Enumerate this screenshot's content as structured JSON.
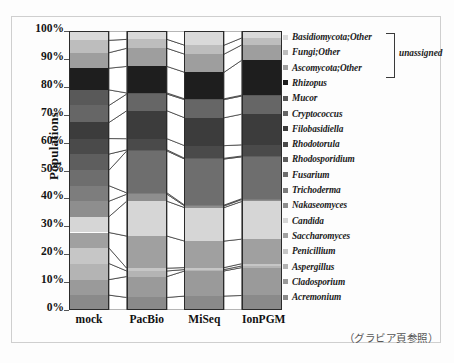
{
  "chart_data": {
    "type": "bar",
    "title": "",
    "xlabel": "",
    "ylabel": "Populations",
    "ylim": [
      0,
      100
    ],
    "ytick_labels": [
      "100%",
      "90%",
      "80%",
      "70%",
      "60%",
      "50%",
      "40%",
      "30%",
      "20%",
      "10%",
      "0%"
    ],
    "ytick_values": [
      100,
      90,
      80,
      70,
      60,
      50,
      40,
      30,
      20,
      10,
      0
    ],
    "categories": [
      "mock",
      "PacBio",
      "MiSeq",
      "IonPGM"
    ],
    "stack_order": "bottom-to-top",
    "grid": false,
    "legend_position": "right",
    "annotations": [
      {
        "text": "unassigned",
        "covers": [
          "Basidiomycota;Other",
          "Fungi;Other",
          "Ascomycota;Other"
        ]
      }
    ],
    "series": [
      {
        "name": "Acremonium",
        "color": "#8a8a8a",
        "values": [
          4.8,
          4.5,
          5.0,
          5.2
        ]
      },
      {
        "name": "Cladosporium",
        "color": "#9a9a9a",
        "values": [
          5.0,
          7.5,
          9.0,
          10.0
        ]
      },
      {
        "name": "Aspergillus",
        "color": "#b4b4b4",
        "values": [
          5.2,
          2.0,
          0.5,
          0.6
        ]
      },
      {
        "name": "Penicillium",
        "color": "#c6c6c6",
        "values": [
          5.0,
          1.0,
          0.7,
          0.8
        ]
      },
      {
        "name": "Saccharomyces",
        "color": "#a0a0a0",
        "values": [
          5.0,
          11.5,
          9.5,
          8.8
        ]
      },
      {
        "name": "Candida",
        "color": "#d6d6d6",
        "values": [
          5.1,
          12.5,
          12.0,
          13.5
        ]
      },
      {
        "name": "Nakaseomyces",
        "color": "#8e8e8e",
        "values": [
          5.0,
          2.5,
          0.6,
          0.7
        ]
      },
      {
        "name": "Trichoderma",
        "color": "#7d7d7d",
        "values": [
          5.0,
          0.5,
          0.3,
          0.3
        ]
      },
      {
        "name": "Fusarium",
        "color": "#6e6e6e",
        "values": [
          5.0,
          15.0,
          16.5,
          15.0
        ]
      },
      {
        "name": "Rhodosporidium",
        "color": "#5e5e5e",
        "values": [
          5.2,
          0.4,
          0.3,
          0.3
        ]
      },
      {
        "name": "Rhodotorula",
        "color": "#4a4a4a",
        "values": [
          5.0,
          4.0,
          4.5,
          4.0
        ]
      },
      {
        "name": "Filobasidiella",
        "color": "#3c3c3c",
        "values": [
          5.2,
          10.0,
          10.0,
          11.0
        ]
      },
      {
        "name": "Cryptococcus",
        "color": "#666666",
        "values": [
          5.5,
          6.0,
          6.5,
          6.5
        ]
      },
      {
        "name": "Mucor",
        "color": "#595959",
        "values": [
          5.0,
          0.4,
          0.3,
          0.3
        ]
      },
      {
        "name": "Rhizopus",
        "color": "#1e1e1e",
        "values": [
          7.0,
          9.5,
          9.5,
          12.5
        ]
      },
      {
        "name": "Ascomycota;Other",
        "color": "#9e9e9e",
        "values": [
          5.0,
          6.5,
          6.5,
          5.5
        ]
      },
      {
        "name": "Fungi;Other",
        "color": "#bdbdbd",
        "values": [
          4.0,
          3.2,
          3.2,
          2.5
        ]
      },
      {
        "name": "Basidiomycota;Other",
        "color": "#d9d9d9",
        "values": [
          3.0,
          3.0,
          5.1,
          2.5
        ]
      }
    ],
    "legend_entries": [
      {
        "label": "Basidiomycota;Other",
        "color": "#d9d9d9"
      },
      {
        "label": "Fungi;Other",
        "color": "#bdbdbd"
      },
      {
        "label": "Ascomycota;Other",
        "color": "#9e9e9e"
      },
      {
        "label": "Rhizopus",
        "color": "#1e1e1e"
      },
      {
        "label": "Mucor",
        "color": "#595959"
      },
      {
        "label": "Cryptococcus",
        "color": "#666666"
      },
      {
        "label": "Filobasidiella",
        "color": "#3c3c3c"
      },
      {
        "label": "Rhodotorula",
        "color": "#4a4a4a"
      },
      {
        "label": "Rhodosporidium",
        "color": "#5e5e5e"
      },
      {
        "label": "Fusarium",
        "color": "#6e6e6e"
      },
      {
        "label": "Trichoderma",
        "color": "#7d7d7d"
      },
      {
        "label": "Nakaseomyces",
        "color": "#8e8e8e"
      },
      {
        "label": "Candida",
        "color": "#d6d6d6"
      },
      {
        "label": "Saccharomyces",
        "color": "#a0a0a0"
      },
      {
        "label": "Penicillium",
        "color": "#c6c6c6"
      },
      {
        "label": "Aspergillus",
        "color": "#b4b4b4"
      },
      {
        "label": "Cladosporium",
        "color": "#9a9a9a"
      },
      {
        "label": "Acremonium",
        "color": "#8a8a8a"
      }
    ]
  },
  "caption": "（グラビア頁参照）"
}
